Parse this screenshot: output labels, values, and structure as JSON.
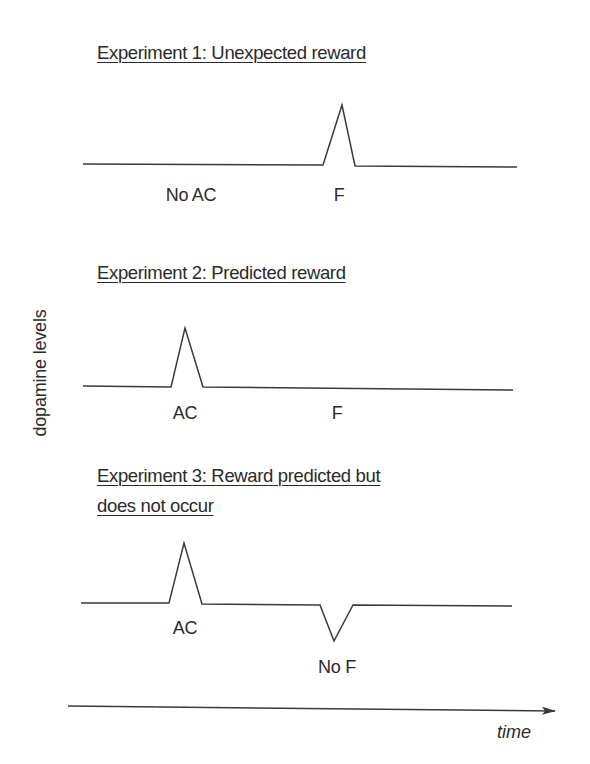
{
  "chart_data": {
    "type": "line",
    "xlabel": "time",
    "ylabel": "dopamine levels",
    "grid": false,
    "legend": null,
    "panels": [
      {
        "title": "Experiment 1: Unexpected reward",
        "title_lines": [
          "Experiment 1: Unexpected reward"
        ],
        "events": [
          {
            "label": "No AC",
            "response": "none"
          },
          {
            "label": "F",
            "response": "peak"
          }
        ],
        "trace": [
          [
            83,
            164
          ],
          [
            323,
            165
          ],
          [
            342,
            105
          ],
          [
            355,
            166
          ],
          [
            517,
            167
          ]
        ],
        "labels_pos": [
          [
            191,
            195
          ],
          [
            339,
            195
          ]
        ],
        "title_top": 38
      },
      {
        "title": "Experiment 2: Predicted reward",
        "title_lines": [
          "Experiment 2: Predicted reward"
        ],
        "events": [
          {
            "label": "AC",
            "response": "peak"
          },
          {
            "label": "F",
            "response": "none"
          }
        ],
        "trace": [
          [
            83,
            386
          ],
          [
            171,
            387
          ],
          [
            185,
            328
          ],
          [
            203,
            387
          ],
          [
            513,
            390
          ]
        ],
        "labels_pos": [
          [
            185,
            413
          ],
          [
            337,
            413
          ]
        ],
        "title_top": 258
      },
      {
        "title": "Experiment 3: Reward predicted but does not occur",
        "title_lines": [
          "Experiment 3: Reward predicted but",
          "does not occur"
        ],
        "events": [
          {
            "label": "AC",
            "response": "peak"
          },
          {
            "label": "No F",
            "response": "dip"
          }
        ],
        "trace": [
          [
            81,
            603
          ],
          [
            169,
            603
          ],
          [
            184,
            543
          ],
          [
            202,
            604
          ],
          [
            320,
            605
          ],
          [
            334,
            641
          ],
          [
            353,
            605
          ],
          [
            512,
            606
          ]
        ],
        "labels_pos": [
          [
            185,
            628
          ],
          [
            337,
            667
          ]
        ],
        "title_top": 461
      }
    ],
    "time_axis": {
      "start": [
        68,
        706
      ],
      "end": [
        555,
        711
      ]
    }
  },
  "figure": {
    "y_axis_label": "dopamine levels",
    "x_axis_label": "time",
    "panel_1": {
      "title": "Experiment 1: Unexpected reward",
      "label_a": "No AC",
      "label_b": "F"
    },
    "panel_2": {
      "title": "Experiment 2: Predicted reward",
      "label_a": "AC",
      "label_b": "F"
    },
    "panel_3": {
      "title_line_1": "Experiment 3: Reward predicted but",
      "title_line_2": "does not occur",
      "label_a": "AC",
      "label_b": "No F"
    }
  },
  "colors": {
    "stroke": "#3a3a3a",
    "text": "#2a2a2a",
    "background": "#ffffff"
  }
}
